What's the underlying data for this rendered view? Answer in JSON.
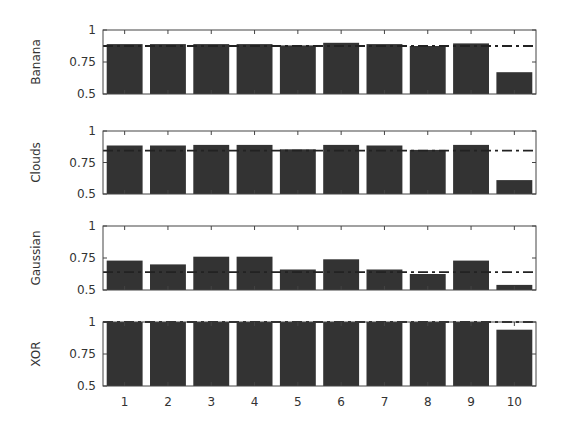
{
  "chart_data": {
    "type": "bar",
    "layout": "4 vertically stacked subplots sharing x-axis",
    "categories": [
      "1",
      "2",
      "3",
      "4",
      "5",
      "6",
      "7",
      "8",
      "9",
      "10"
    ],
    "ylim": [
      0.5,
      1
    ],
    "yticks": [
      "0.5",
      "0.75",
      "1"
    ],
    "grid": false,
    "legend": null,
    "bar_color": "#333333",
    "reference_line_style": "dash-dot",
    "subplots": [
      {
        "ylabel": "Banana",
        "values": [
          0.89,
          0.89,
          0.89,
          0.89,
          0.88,
          0.9,
          0.89,
          0.875,
          0.895,
          0.67
        ],
        "reference_line": 0.875
      },
      {
        "ylabel": "Clouds",
        "values": [
          0.885,
          0.885,
          0.89,
          0.89,
          0.855,
          0.89,
          0.885,
          0.85,
          0.89,
          0.61
        ],
        "reference_line": 0.845
      },
      {
        "ylabel": "Gaussian",
        "values": [
          0.73,
          0.7,
          0.76,
          0.76,
          0.66,
          0.74,
          0.66,
          0.625,
          0.73,
          0.54
        ],
        "reference_line": 0.64
      },
      {
        "ylabel": "XOR",
        "values": [
          1.0,
          1.0,
          1.0,
          1.0,
          1.0,
          1.0,
          1.0,
          1.0,
          1.0,
          0.94
        ],
        "reference_line": 1.0
      }
    ],
    "xlabel": "",
    "title": ""
  }
}
